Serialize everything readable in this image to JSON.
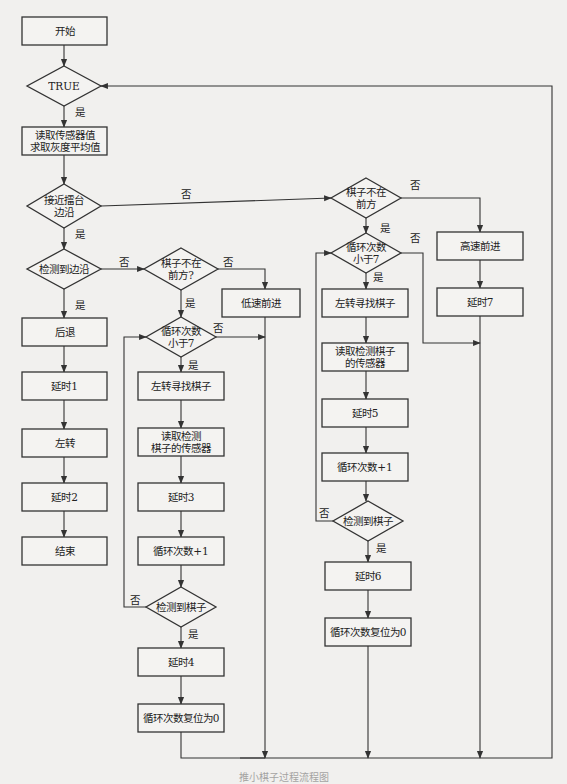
{
  "figure": {
    "caption": "推小棋子过程流程图"
  },
  "nodes": [
    {
      "id": "start",
      "type": "rect",
      "x": 22,
      "y": 17,
      "w": 85,
      "h": 28,
      "lines": [
        "开始"
      ]
    },
    {
      "id": "true",
      "type": "diamond",
      "cx": 64,
      "cy": 86,
      "hw": 37,
      "hh": 20,
      "lines": [
        "TRUE"
      ]
    },
    {
      "id": "read_sensors",
      "type": "rect",
      "x": 22,
      "y": 127,
      "w": 85,
      "h": 28,
      "lines": [
        "读取传感器值",
        "求取灰度平均值"
      ]
    },
    {
      "id": "near_edge",
      "type": "diamond",
      "cx": 64,
      "cy": 206,
      "hw": 37,
      "hh": 22,
      "lines": [
        "接近擂台",
        "边沿"
      ]
    },
    {
      "id": "edge_detected",
      "type": "diamond",
      "cx": 64,
      "cy": 269,
      "hw": 37,
      "hh": 20,
      "lines": [
        "检测到边沿"
      ]
    },
    {
      "id": "retreat",
      "type": "rect",
      "x": 22,
      "y": 318,
      "w": 85,
      "h": 28,
      "lines": [
        "后退"
      ]
    },
    {
      "id": "delay1",
      "type": "rect",
      "x": 22,
      "y": 372,
      "w": 85,
      "h": 28,
      "lines": [
        "延时1"
      ]
    },
    {
      "id": "turn_left",
      "type": "rect",
      "x": 22,
      "y": 429,
      "w": 85,
      "h": 28,
      "lines": [
        "左转"
      ]
    },
    {
      "id": "delay2",
      "type": "rect",
      "x": 22,
      "y": 483,
      "w": 85,
      "h": 28,
      "lines": [
        "延时2"
      ]
    },
    {
      "id": "end",
      "type": "rect",
      "x": 22,
      "y": 537,
      "w": 85,
      "h": 28,
      "lines": [
        "结束"
      ]
    },
    {
      "id": "piece_not_front_a",
      "type": "diamond",
      "cx": 181,
      "cy": 269,
      "hw": 37,
      "hh": 21,
      "lines": [
        "棋子不在",
        "前方?"
      ]
    },
    {
      "id": "slow_forward",
      "type": "rect",
      "x": 222,
      "y": 289,
      "w": 78,
      "h": 28,
      "lines": [
        "低速前进"
      ]
    },
    {
      "id": "loop_lt7_a",
      "type": "diamond",
      "cx": 181,
      "cy": 337,
      "hw": 35,
      "hh": 20,
      "lines": [
        "循环次数",
        "小于7"
      ]
    },
    {
      "id": "turn_search_a",
      "type": "rect",
      "x": 138,
      "y": 372,
      "w": 86,
      "h": 28,
      "lines": [
        "左转寻找棋子"
      ]
    },
    {
      "id": "read_piece_a",
      "type": "rect",
      "x": 138,
      "y": 428,
      "w": 86,
      "h": 28,
      "lines": [
        "读取检测",
        "棋子的传感器"
      ]
    },
    {
      "id": "delay3",
      "type": "rect",
      "x": 138,
      "y": 483,
      "w": 86,
      "h": 28,
      "lines": [
        "延时3"
      ]
    },
    {
      "id": "loop_inc_a",
      "type": "rect",
      "x": 138,
      "y": 537,
      "w": 86,
      "h": 28,
      "lines": [
        "循环次数+1"
      ]
    },
    {
      "id": "piece_found_a",
      "type": "diamond",
      "cx": 181,
      "cy": 607,
      "hw": 35,
      "hh": 20,
      "lines": [
        "检测到棋子"
      ]
    },
    {
      "id": "delay4",
      "type": "rect",
      "x": 138,
      "y": 648,
      "w": 86,
      "h": 28,
      "lines": [
        "延时4"
      ]
    },
    {
      "id": "loop_reset_a",
      "type": "rect",
      "x": 138,
      "y": 704,
      "w": 86,
      "h": 28,
      "lines": [
        "循环次数复位为0"
      ]
    },
    {
      "id": "piece_not_front_b",
      "type": "diamond",
      "cx": 366,
      "cy": 198,
      "hw": 35,
      "hh": 20,
      "lines": [
        "棋子不在",
        "前方"
      ]
    },
    {
      "id": "fast_forward",
      "type": "rect",
      "x": 437,
      "y": 232,
      "w": 86,
      "h": 28,
      "lines": [
        "高速前进"
      ]
    },
    {
      "id": "delay7",
      "type": "rect",
      "x": 437,
      "y": 288,
      "w": 86,
      "h": 28,
      "lines": [
        "延时7"
      ]
    },
    {
      "id": "loop_lt7_b",
      "type": "diamond",
      "cx": 366,
      "cy": 253,
      "hw": 35,
      "hh": 20,
      "lines": [
        "循环次数",
        "小于7"
      ]
    },
    {
      "id": "turn_search_b",
      "type": "rect",
      "x": 322,
      "y": 289,
      "w": 86,
      "h": 28,
      "lines": [
        "左转寻找棋子"
      ]
    },
    {
      "id": "read_piece_b",
      "type": "rect",
      "x": 322,
      "y": 343,
      "w": 86,
      "h": 28,
      "lines": [
        "读取检测棋子",
        "的传感器"
      ]
    },
    {
      "id": "delay5",
      "type": "rect",
      "x": 322,
      "y": 399,
      "w": 86,
      "h": 28,
      "lines": [
        "延时5"
      ]
    },
    {
      "id": "loop_inc_b",
      "type": "rect",
      "x": 322,
      "y": 453,
      "w": 86,
      "h": 28,
      "lines": [
        "循环次数+1"
      ]
    },
    {
      "id": "piece_found_b",
      "type": "diamond",
      "cx": 368,
      "cy": 521,
      "hw": 35,
      "hh": 20,
      "lines": [
        "检测到棋子"
      ]
    },
    {
      "id": "delay6",
      "type": "rect",
      "x": 325,
      "y": 562,
      "w": 86,
      "h": 28,
      "lines": [
        "延时6"
      ]
    },
    {
      "id": "loop_reset_b",
      "type": "rect",
      "x": 325,
      "y": 618,
      "w": 86,
      "h": 28,
      "lines": [
        "循环次数复位为0"
      ]
    }
  ],
  "edge_labels": [
    {
      "x": 80,
      "y": 112,
      "text": "是"
    },
    {
      "x": 80,
      "y": 234,
      "text": "是"
    },
    {
      "x": 186,
      "y": 194,
      "text": "否"
    },
    {
      "x": 124,
      "y": 262,
      "text": "否"
    },
    {
      "x": 80,
      "y": 305,
      "text": "是"
    },
    {
      "x": 228,
      "y": 262,
      "text": "否"
    },
    {
      "x": 190,
      "y": 303,
      "text": "是"
    },
    {
      "x": 218,
      "y": 328,
      "text": "否"
    },
    {
      "x": 193,
      "y": 365,
      "text": "是"
    },
    {
      "x": 135,
      "y": 600,
      "text": "否"
    },
    {
      "x": 193,
      "y": 634,
      "text": "是"
    },
    {
      "x": 415,
      "y": 185,
      "text": "否"
    },
    {
      "x": 385,
      "y": 228,
      "text": "是"
    },
    {
      "x": 415,
      "y": 238,
      "text": "否"
    },
    {
      "x": 378,
      "y": 277,
      "text": "是"
    },
    {
      "x": 324,
      "y": 513,
      "text": "否"
    },
    {
      "x": 381,
      "y": 548,
      "text": "是"
    }
  ],
  "edges": [
    {
      "points": [
        [
          64,
          45
        ],
        [
          64,
          66
        ]
      ],
      "arrow": true
    },
    {
      "points": [
        [
          64,
          106
        ],
        [
          64,
          127
        ]
      ],
      "arrow": true
    },
    {
      "points": [
        [
          64,
          155
        ],
        [
          64,
          184
        ]
      ],
      "arrow": true
    },
    {
      "points": [
        [
          64,
          228
        ],
        [
          64,
          249
        ]
      ],
      "arrow": true
    },
    {
      "points": [
        [
          64,
          289
        ],
        [
          64,
          318
        ]
      ],
      "arrow": true
    },
    {
      "points": [
        [
          64,
          346
        ],
        [
          64,
          372
        ]
      ],
      "arrow": true
    },
    {
      "points": [
        [
          64,
          400
        ],
        [
          64,
          429
        ]
      ],
      "arrow": true
    },
    {
      "points": [
        [
          64,
          457
        ],
        [
          64,
          483
        ]
      ],
      "arrow": true
    },
    {
      "points": [
        [
          64,
          511
        ],
        [
          64,
          537
        ]
      ],
      "arrow": true
    },
    {
      "points": [
        [
          101,
          206
        ],
        [
          331,
          198
        ]
      ],
      "arrow": true
    },
    {
      "points": [
        [
          101,
          269
        ],
        [
          144,
          269
        ]
      ],
      "arrow": true
    },
    {
      "points": [
        [
          218,
          269
        ],
        [
          265,
          269
        ],
        [
          265,
          289
        ]
      ],
      "arrow": true
    },
    {
      "points": [
        [
          181,
          290
        ],
        [
          181,
          317
        ]
      ],
      "arrow": true
    },
    {
      "points": [
        [
          216,
          337
        ],
        [
          265,
          337
        ]
      ],
      "arrow": true
    },
    {
      "points": [
        [
          181,
          357
        ],
        [
          181,
          372
        ]
      ],
      "arrow": true
    },
    {
      "points": [
        [
          181,
          400
        ],
        [
          181,
          428
        ]
      ],
      "arrow": true
    },
    {
      "points": [
        [
          181,
          456
        ],
        [
          181,
          483
        ]
      ],
      "arrow": true
    },
    {
      "points": [
        [
          181,
          511
        ],
        [
          181,
          537
        ]
      ],
      "arrow": true
    },
    {
      "points": [
        [
          181,
          565
        ],
        [
          181,
          587
        ]
      ],
      "arrow": true
    },
    {
      "points": [
        [
          146,
          607
        ],
        [
          124,
          607
        ],
        [
          124,
          337
        ],
        [
          146,
          337
        ]
      ],
      "arrow": true
    },
    {
      "points": [
        [
          181,
          627
        ],
        [
          181,
          648
        ]
      ],
      "arrow": true
    },
    {
      "points": [
        [
          181,
          676
        ],
        [
          181,
          704
        ]
      ],
      "arrow": true
    },
    {
      "points": [
        [
          181,
          732
        ],
        [
          181,
          758
        ],
        [
          265,
          758
        ]
      ],
      "arrow": false
    },
    {
      "points": [
        [
          265,
          317
        ],
        [
          265,
          758
        ]
      ],
      "arrow": true
    },
    {
      "points": [
        [
          401,
          198
        ],
        [
          480,
          198
        ],
        [
          480,
          232
        ]
      ],
      "arrow": true
    },
    {
      "points": [
        [
          480,
          260
        ],
        [
          480,
          288
        ]
      ],
      "arrow": true
    },
    {
      "points": [
        [
          480,
          316
        ],
        [
          480,
          758
        ]
      ],
      "arrow": true
    },
    {
      "points": [
        [
          366,
          218
        ],
        [
          366,
          233
        ]
      ],
      "arrow": true
    },
    {
      "points": [
        [
          401,
          253
        ],
        [
          423,
          253
        ],
        [
          423,
          343
        ],
        [
          480,
          343
        ]
      ],
      "arrow": true
    },
    {
      "points": [
        [
          366,
          273
        ],
        [
          366,
          289
        ]
      ],
      "arrow": true
    },
    {
      "points": [
        [
          366,
          317
        ],
        [
          366,
          343
        ]
      ],
      "arrow": true
    },
    {
      "points": [
        [
          366,
          371
        ],
        [
          366,
          399
        ]
      ],
      "arrow": true
    },
    {
      "points": [
        [
          366,
          427
        ],
        [
          366,
          453
        ]
      ],
      "arrow": true
    },
    {
      "points": [
        [
          366,
          481
        ],
        [
          366,
          501
        ]
      ],
      "arrow": true
    },
    {
      "points": [
        [
          333,
          521
        ],
        [
          316,
          521
        ],
        [
          316,
          253
        ],
        [
          331,
          253
        ]
      ],
      "arrow": true
    },
    {
      "points": [
        [
          368,
          541
        ],
        [
          368,
          562
        ]
      ],
      "arrow": true
    },
    {
      "points": [
        [
          368,
          590
        ],
        [
          368,
          618
        ]
      ],
      "arrow": true
    },
    {
      "points": [
        [
          368,
          646
        ],
        [
          368,
          758
        ]
      ],
      "arrow": true
    },
    {
      "points": [
        [
          240,
          758
        ],
        [
          552,
          758
        ],
        [
          552,
          86
        ],
        [
          101,
          86
        ]
      ],
      "arrow": true
    }
  ]
}
